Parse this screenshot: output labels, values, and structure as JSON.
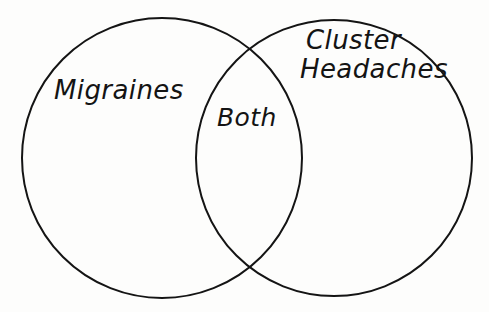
{
  "diagram": {
    "type": "venn-2-circle",
    "background_color": "#fdfdfc",
    "stroke_color": "#141414",
    "stroke_width": 2,
    "fill": "none",
    "left_set": {
      "label": "Migraines",
      "center_x": 162,
      "center_y": 158,
      "radius": 140
    },
    "right_set": {
      "label_line_1": "Cluster",
      "label_line_2": "Headaches",
      "label_full": "Cluster Headaches",
      "center_x": 334,
      "center_y": 158,
      "radius": 138
    },
    "intersection": {
      "label": "Both",
      "top_point_x": 250,
      "top_point_y": 47,
      "bottom_point_x": 250,
      "bottom_point_y": 270
    }
  }
}
